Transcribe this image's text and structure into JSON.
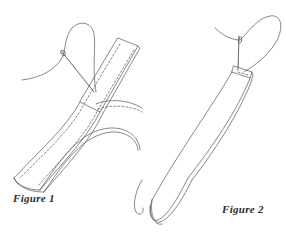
{
  "figures": [
    {
      "id": "figure-1",
      "caption": "Figure 1",
      "subject": "strip of fabric folded in a curve, stitched along edges with needle and thread"
    },
    {
      "id": "figure-2",
      "caption": "Figure 2",
      "subject": "folded fabric strip forming a loop, needle and thread at top end"
    }
  ],
  "colors": {
    "line": "#555555",
    "background": "#ffffff",
    "caption": "#2a2a2a"
  }
}
